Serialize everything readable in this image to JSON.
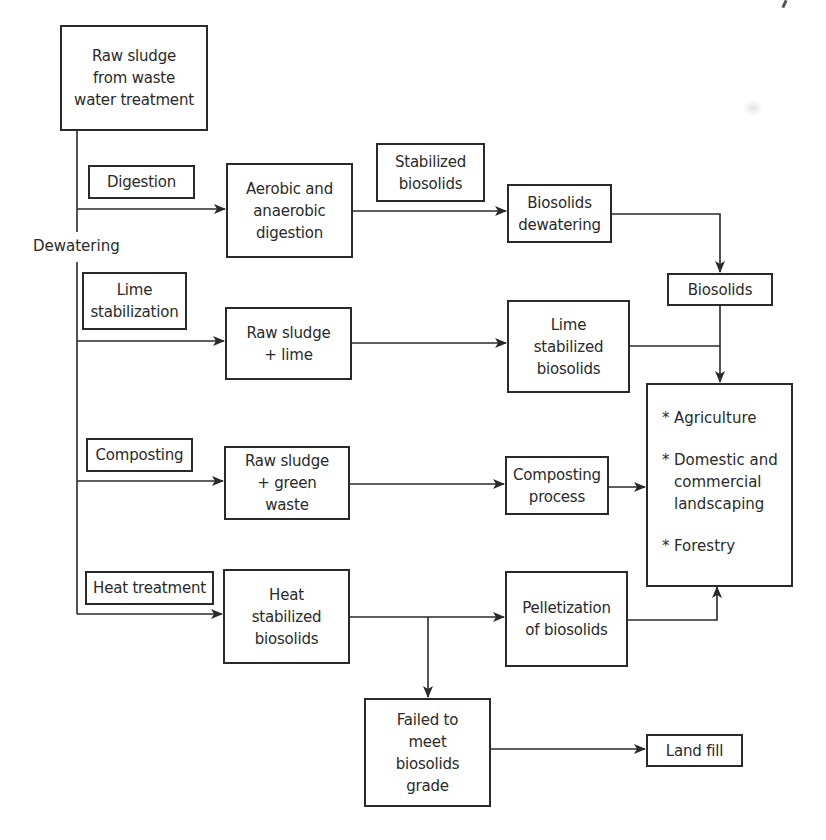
{
  "diagram": {
    "type": "process-flowchart",
    "nodes": {
      "raw_sludge": "Raw sludge\nfrom waste\nwater treatment",
      "dewatering": "Dewatering",
      "digestion": "Digestion",
      "aerobic": "Aerobic and\nanaerobic\ndigestion",
      "stabilized_biosolids": "Stabilized\nbiosolids",
      "biosolids_dewatering": "Biosolids\ndewatering",
      "biosolids": "Biosolids",
      "lime_stabilization": "Lime\nstabilization",
      "raw_sludge_lime": "Raw sludge\n+ lime",
      "lime_stabilized": "Lime\nstabilized\nbiosolids",
      "composting": "Composting",
      "raw_sludge_green": "Raw sludge\n+ green\nwaste",
      "composting_process": "Composting\nprocess",
      "heat_treatment": "Heat treatment",
      "heat_stabilized": "Heat\nstabilized\nbiosolids",
      "pelletization": "Pelletization\nof biosolids",
      "failed": "Failed to\nmeet\nbiosolids\ngrade",
      "landfill": "Land fill"
    },
    "end_uses": {
      "bullet": "*",
      "items": [
        "Agriculture",
        "Domestic and\ncommercial\nlandscaping",
        "Forestry"
      ]
    },
    "edges": [
      {
        "from": "raw_sludge",
        "to": "aerobic",
        "label": "Digestion"
      },
      {
        "from": "aerobic",
        "to": "biosolids_dewatering",
        "label": "Stabilized biosolids"
      },
      {
        "from": "biosolids_dewatering",
        "to": "biosolids"
      },
      {
        "from": "biosolids",
        "to": "end_uses"
      },
      {
        "from": "raw_sludge",
        "to": "raw_sludge_lime",
        "label": "Lime stabilization"
      },
      {
        "from": "raw_sludge_lime",
        "to": "lime_stabilized"
      },
      {
        "from": "lime_stabilized",
        "to": "end_uses"
      },
      {
        "from": "raw_sludge",
        "to": "raw_sludge_green",
        "label": "Composting"
      },
      {
        "from": "raw_sludge_green",
        "to": "composting_process"
      },
      {
        "from": "composting_process",
        "to": "end_uses"
      },
      {
        "from": "raw_sludge",
        "to": "heat_stabilized",
        "label": "Heat treatment"
      },
      {
        "from": "heat_stabilized",
        "to": "pelletization"
      },
      {
        "from": "pelletization",
        "to": "end_uses"
      },
      {
        "from": "heat_stabilized",
        "to": "failed"
      },
      {
        "from": "failed",
        "to": "landfill"
      }
    ]
  }
}
